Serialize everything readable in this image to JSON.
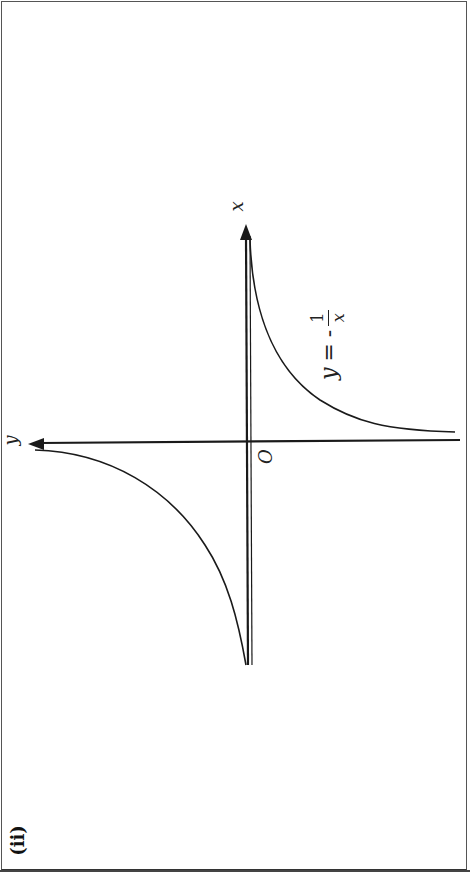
{
  "figure": {
    "part_label": "(ii)",
    "rotation_deg": -90,
    "axes": {
      "x_label": "x",
      "y_label": "y",
      "origin_label": "O"
    },
    "equation_label": "y = -1/x",
    "equation_parts": {
      "lhs": "y",
      "eq": "=",
      "neg": "-",
      "num": "1",
      "den": "x"
    },
    "colors": {
      "ink": "#1a1a1a",
      "frame": "#555555",
      "background": "#ffffff"
    }
  }
}
